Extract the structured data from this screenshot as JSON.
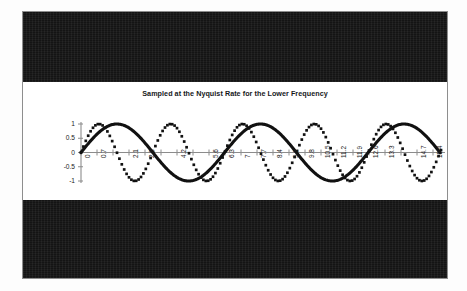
{
  "figure": {
    "title": "Sampled at the Nyquist Rate for the Lower Frequency",
    "frame_color": "#141414",
    "plot_background": "#ffffff",
    "ink_color": "#111111",
    "axis_color": "#8c8c8c"
  },
  "chart_data": {
    "type": "line",
    "title": "Sampled at the Nyquist Rate for the Lower Frequency",
    "xlabel": "",
    "ylabel": "",
    "ylim": [
      -1,
      1
    ],
    "xlim": [
      0,
      15.75
    ],
    "grid": false,
    "legend": "none",
    "yticks": [
      1,
      0.5,
      0,
      -0.5,
      -1
    ],
    "ytick_labels": [
      "1",
      "0.5",
      "0",
      "-0.5",
      "-1"
    ],
    "xtick_step": 0.7,
    "xtick_labels": [
      "0",
      "0.7",
      "1.4",
      "2.1",
      "2.8",
      "3.5",
      "4.2",
      "4.9",
      "5.6",
      "6.3",
      "7",
      "7.7",
      "8.4",
      "9.1",
      "9.8",
      "10.5",
      "11.2",
      "11.9",
      "12.6",
      "13.3",
      "14",
      "14.7",
      "15.4"
    ],
    "xtick_labels_shown": [
      "0",
      "0.7",
      "2.1",
      "2.8",
      "4.2",
      "5.6",
      "6.3",
      "7",
      "7.7",
      "8.4",
      "9.1",
      "9.8",
      "10.5",
      "11.2",
      "11.9",
      "12.6",
      "13.3",
      "14.7",
      "15.4"
    ],
    "series": [
      {
        "name": "lower-frequency sine (continuous)",
        "style": "solid-thick",
        "marker": "none",
        "amplitude": 1,
        "frequency_rad_per_unit": 1.0,
        "phase": 0,
        "description": "smooth continuous sine with about 2.5 cycles across the axis"
      },
      {
        "name": "sampled wave (square markers)",
        "style": "marker-line",
        "marker": "square",
        "amplitude": 1,
        "frequency_rad_per_unit": 2.0,
        "phase": 0,
        "description": "higher-frequency sine drawn as discrete square sample points at the Nyquist rate of the lower frequency"
      }
    ]
  }
}
